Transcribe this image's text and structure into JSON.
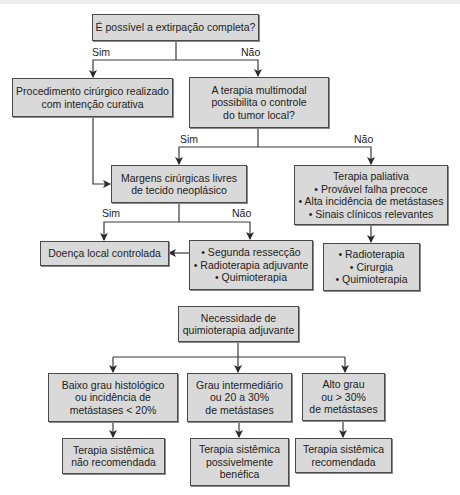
{
  "flowchart_1": {
    "q_extirpation": {
      "lines": [
        "É possível a extirpação completa?"
      ]
    },
    "surgery_curative": {
      "lines": [
        "Procedimento cirúrgico realizado",
        "com intenção curativa"
      ]
    },
    "q_multimodal": {
      "lines": [
        "A terapia multimodal",
        "possibilita o controle",
        "do tumor local?"
      ]
    },
    "margins_free": {
      "lines": [
        "Margens cirúrgicas livres",
        "de tecido neoplásico"
      ]
    },
    "palliative": {
      "lines": [
        "Terapia paliativa",
        "• Provável falha precoce",
        "• Alta incidência de metástases",
        "• Sinais clínicos relevantes"
      ]
    },
    "local_controlled": {
      "lines": [
        "Doença local controlada"
      ]
    },
    "second_options": {
      "lines": [
        "• Segunda ressecção",
        "• Radioterapia adjuvante",
        "• Quimioterapia"
      ]
    },
    "palliative_options": {
      "lines": [
        "• Radioterapia",
        "• Cirurgia",
        "• Quimioterapia"
      ]
    },
    "edge_labels": {
      "extirpation_yes": "Sim",
      "extirpation_no": "Não",
      "multimodal_yes": "Sim",
      "multimodal_no": "Não",
      "margins_yes": "Sim",
      "margins_no": "Não"
    }
  },
  "flowchart_2": {
    "q_chemo": {
      "lines": [
        "Necessidade de",
        "quimioterapia adjuvante"
      ]
    },
    "low_grade": {
      "lines": [
        "Baixo grau histológico",
        "ou incidência de",
        "metástases < 20%"
      ]
    },
    "mid_grade": {
      "lines": [
        "Grau intermediário",
        "ou 20 a 30%",
        "de metástases"
      ]
    },
    "high_grade": {
      "lines": [
        "Alto grau",
        "ou > 30%",
        "de metástases"
      ]
    },
    "not_recommended": {
      "lines": [
        "Terapia sistêmica",
        "não recomendada"
      ]
    },
    "possibly_beneficial": {
      "lines": [
        "Terapia sistêmica",
        "possivelmente",
        "benéfica"
      ]
    },
    "recommended": {
      "lines": [
        "Terapia sistêmica",
        "recomendada"
      ]
    }
  }
}
